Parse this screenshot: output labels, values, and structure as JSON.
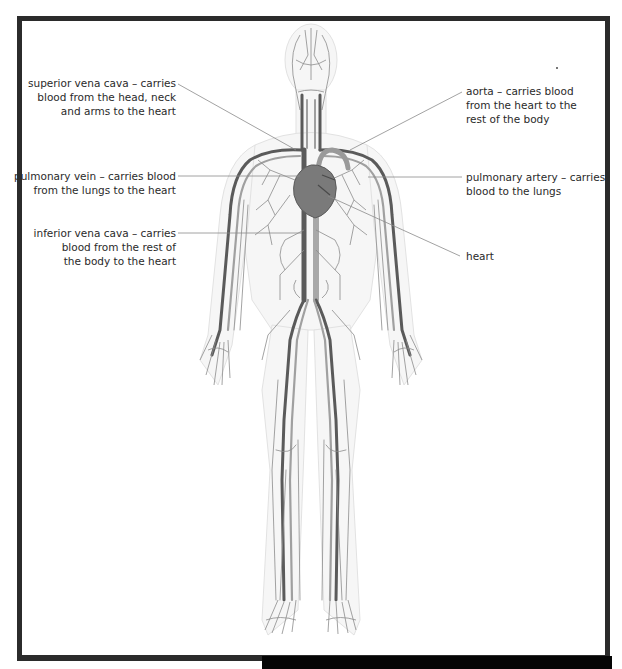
{
  "figure": {
    "colors": {
      "frame": "#2b2b2b",
      "background": "#ffffff",
      "vessel_dark": "#5a5a5a",
      "vessel_light": "#9a9a9a",
      "heart": "#7a7a7a",
      "leader_line": "#8a8a8a",
      "text": "#2a2a2a"
    }
  },
  "labels": {
    "superior_vena_cava": "superior vena cava – carries\nblood from the head, neck\nand arms to the heart",
    "pulmonary_vein": "pulmonary vein – carries blood\nfrom the lungs to the heart",
    "inferior_vena_cava": "inferior vena cava – carries\nblood from the rest of\nthe body to the heart",
    "aorta": "aorta – carries blood\nfrom the heart to the\nrest of the body",
    "pulmonary_artery": "pulmonary artery – carries\nblood to the lungs",
    "heart": "heart"
  }
}
